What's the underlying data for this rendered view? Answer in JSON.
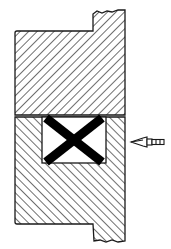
{
  "diagram": {
    "type": "mechanical-cross-section",
    "colors": {
      "background": "#ffffff",
      "line": "#1a1a1a",
      "hatch": "#222222",
      "seal": "#000000"
    },
    "parts": [
      {
        "name": "upper-block",
        "hatch": "forward-diagonal"
      },
      {
        "name": "lower-block",
        "hatch": "backward-diagonal"
      },
      {
        "name": "seal-cavity",
        "symbol": "X"
      },
      {
        "name": "pressure-arrow",
        "direction": "left"
      }
    ]
  }
}
